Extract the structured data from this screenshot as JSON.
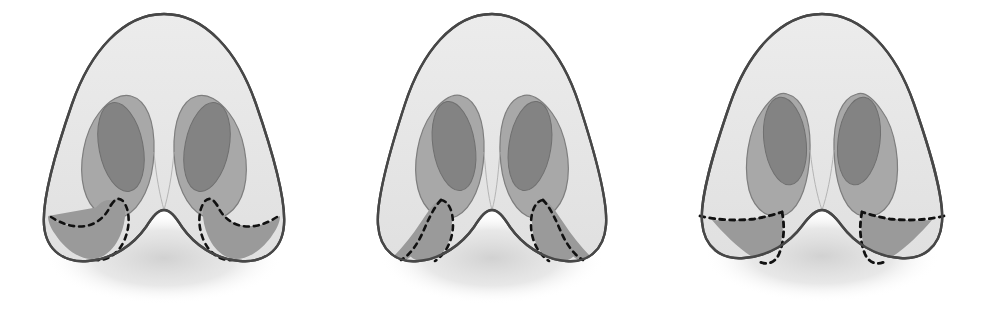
{
  "figure": {
    "panel_count": 3,
    "background_color": "#ffffff",
    "label_text": ""
  },
  "palette": {
    "outline": "#474747",
    "skin_fill": "#e3e3e3",
    "skin_fill_light": "#eaeaea",
    "vestibule_fill": "#a8a8a8",
    "nostril_fill": "#808080",
    "excision_fill": "#9a9a9a",
    "dashed_marking": "#1a1a1a",
    "shadow": "#d8d8d8",
    "columella_fill": "#e6e6e6"
  },
  "geometry": {
    "panel_width": 328,
    "panel_height": 310,
    "nose_tip_y": 14,
    "nose_base_y": 262
  },
  "panels": [
    {
      "id": "panel-1",
      "index": 1,
      "name": "combined-sill-and-wedge-excision",
      "excision_type": "combined",
      "excision_label": "Combined nostril sill and alar wedge excision",
      "marking_style": "dashed",
      "alar_flare": "wide",
      "offset_x": 0,
      "caption": ""
    },
    {
      "id": "panel-2",
      "index": 2,
      "name": "nostril-sill-excision",
      "excision_type": "sill",
      "excision_label": "Nostril sill excision",
      "marking_style": "dashed",
      "alar_flare": "medium",
      "offset_x": 328,
      "caption": ""
    },
    {
      "id": "panel-3",
      "index": 3,
      "name": "alar-wedge-excision",
      "excision_type": "wedge",
      "excision_label": "Alar base wedge excision",
      "marking_style": "dashed",
      "alar_flare": "wide-lateral",
      "offset_x": 657,
      "caption": ""
    }
  ]
}
